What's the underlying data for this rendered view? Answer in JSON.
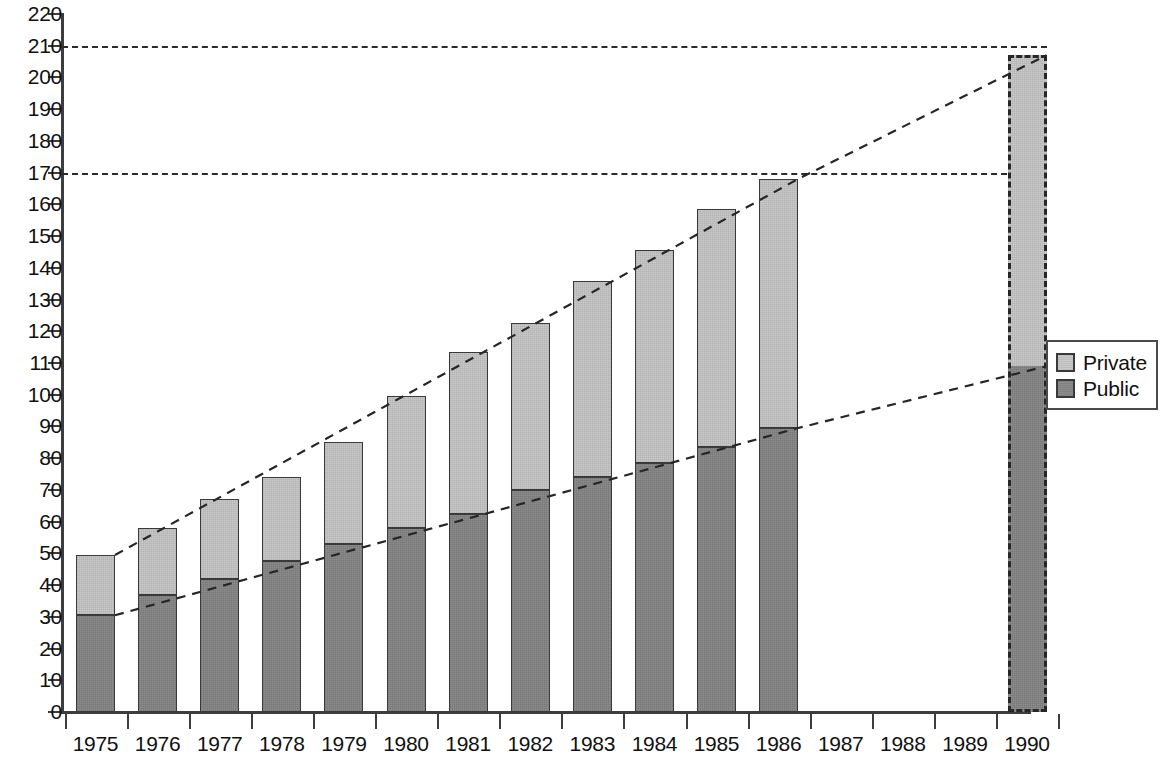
{
  "chart_data": {
    "type": "bar",
    "subtype": "stacked-bar-with-trendlines",
    "title": "",
    "xlabel": "",
    "ylabel": "",
    "categories": [
      "1975",
      "1976",
      "1977",
      "1978",
      "1979",
      "1980",
      "1981",
      "1982",
      "1983",
      "1984",
      "1985",
      "1986",
      "1987",
      "1988",
      "1989",
      "1990"
    ],
    "series": [
      {
        "name": "Public",
        "color": "#8c8c8c",
        "values": [
          30.5,
          37,
          42,
          47.5,
          53,
          58,
          62.5,
          70,
          74,
          78.5,
          83.5,
          89.5,
          null,
          null,
          null,
          109
        ]
      },
      {
        "name": "Private",
        "color": "#c9c9c9",
        "values": [
          19,
          21,
          25,
          26.5,
          32,
          41.5,
          51,
          52.5,
          62,
          67,
          75,
          78.5,
          null,
          null,
          null,
          98
        ]
      }
    ],
    "totals": [
      49.5,
      58,
      67,
      74,
      85,
      99.5,
      113.5,
      122.5,
      136,
      145.5,
      158.5,
      168,
      null,
      null,
      null,
      207
    ],
    "ylim": [
      0,
      220
    ],
    "ytick_step": 10,
    "yticks": [
      0,
      10,
      20,
      30,
      40,
      50,
      60,
      70,
      80,
      90,
      100,
      110,
      120,
      130,
      140,
      150,
      160,
      170,
      180,
      190,
      200,
      210,
      220
    ],
    "grid": false,
    "reference_lines": [
      {
        "value": 210,
        "style": "dashed",
        "label": ""
      },
      {
        "value": 170,
        "style": "dashed",
        "label": ""
      }
    ],
    "trend_lines": [
      {
        "name": "total-trend",
        "style": "dashed",
        "points": [
          {
            "x": "1975",
            "y": 49.5
          },
          {
            "x": "1986",
            "y": 168
          },
          {
            "x": "1990",
            "y": 207
          }
        ]
      },
      {
        "name": "public-trend",
        "style": "dashed",
        "points": [
          {
            "x": "1975",
            "y": 30.5
          },
          {
            "x": "1986",
            "y": 89.5
          },
          {
            "x": "1990",
            "y": 109
          }
        ]
      }
    ],
    "projected_categories": [
      "1990"
    ],
    "empty_categories": [
      "1987",
      "1988",
      "1989"
    ],
    "legend": {
      "position": "right",
      "entries": [
        {
          "label": "Private",
          "color": "#c9c9c9"
        },
        {
          "label": "Public",
          "color": "#8c8c8c"
        }
      ]
    }
  },
  "axis": {
    "y_labels": [
      "220",
      "210",
      "200",
      "190",
      "180",
      "170",
      "160",
      "150",
      "140",
      "130",
      "120",
      "110",
      "100",
      "90",
      "80",
      "70",
      "60",
      "50",
      "40",
      "30",
      "20",
      "10",
      "0"
    ],
    "x_labels": [
      "1975",
      "1976",
      "1977",
      "1978",
      "1979",
      "1980",
      "1981",
      "1982",
      "1983",
      "1984",
      "1985",
      "1986",
      "1987",
      "1988",
      "1989",
      "1990"
    ]
  },
  "legend": {
    "private_label": "Private",
    "public_label": "Public"
  },
  "colors": {
    "private": "#c9c9c9",
    "public": "#8c8c8c",
    "axis": "#3d3d3d",
    "outline": "#3a3a3a"
  }
}
